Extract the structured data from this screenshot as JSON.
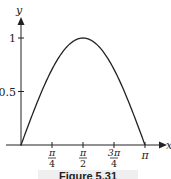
{
  "chart_data": {
    "type": "line",
    "title": "",
    "xlabel": "x",
    "ylabel": "y",
    "function": "sin(x)",
    "xlim": [
      0,
      3.14159
    ],
    "ylim": [
      0,
      1
    ],
    "x_ticks": [
      {
        "value": 0.7854,
        "num": "π",
        "den": "4"
      },
      {
        "value": 1.5708,
        "num": "π",
        "den": "2"
      },
      {
        "value": 2.3562,
        "num": "3π",
        "den": "4"
      },
      {
        "value": 3.14159,
        "label": "π"
      }
    ],
    "y_ticks": [
      {
        "value": 0.5,
        "label": "0.5"
      },
      {
        "value": 1,
        "label": "1"
      }
    ],
    "series": [
      {
        "name": "y = sin x",
        "x": [
          0,
          0.3927,
          0.7854,
          1.1781,
          1.5708,
          1.9635,
          2.3562,
          2.7489,
          3.14159
        ],
        "values": [
          0,
          0.383,
          0.707,
          0.924,
          1,
          0.924,
          0.707,
          0.383,
          0
        ]
      }
    ],
    "grid": false,
    "legend": "none"
  },
  "caption": "Figure 5.31"
}
